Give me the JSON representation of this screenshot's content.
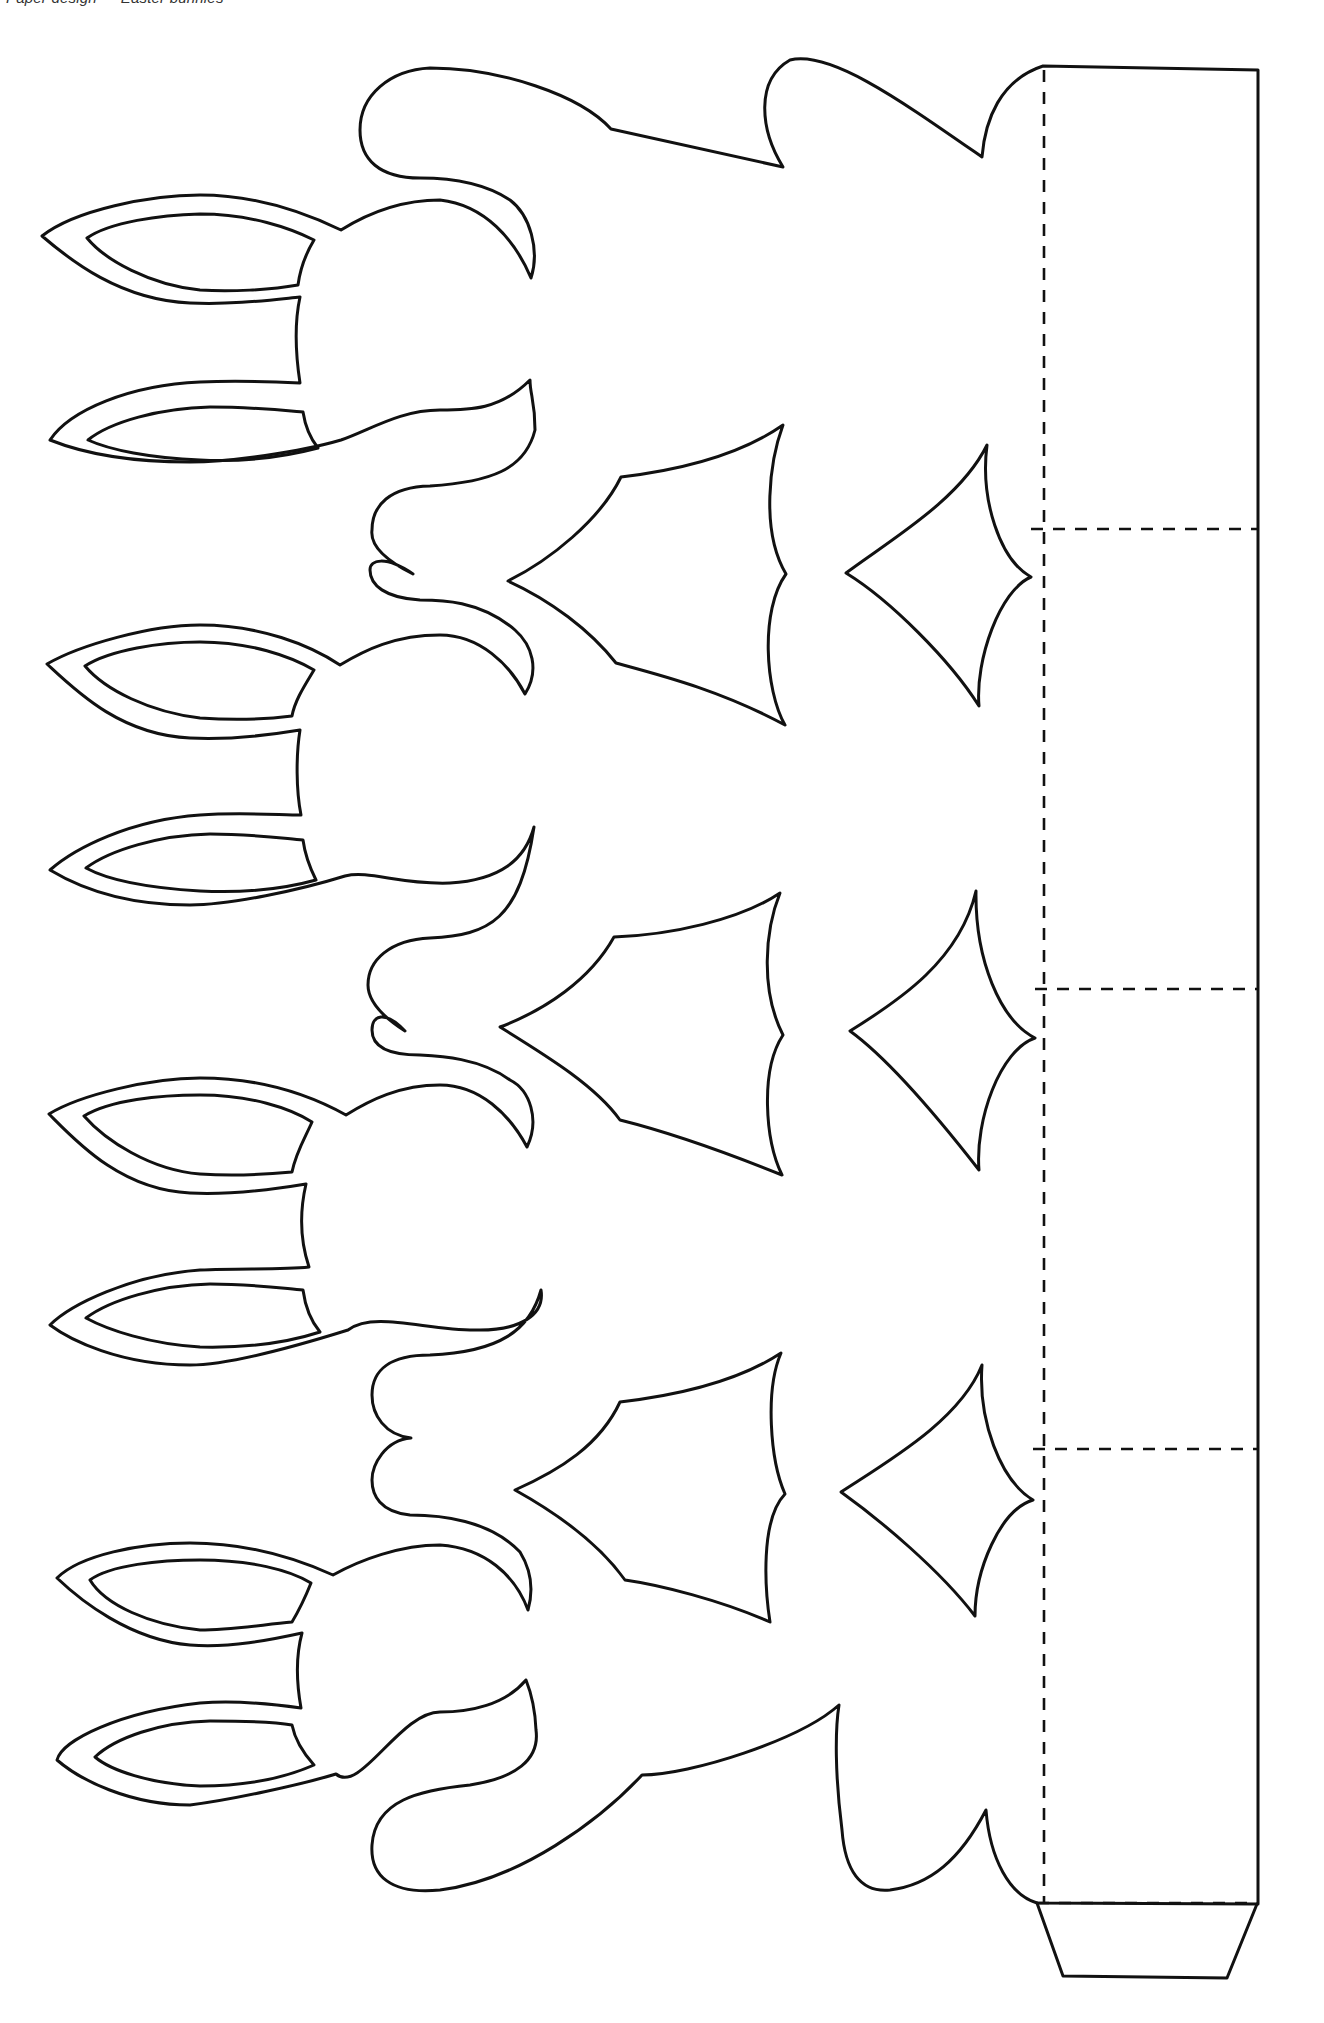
{
  "document": {
    "header_text": "Paper design — Easter bunnies",
    "header_note": "clipped at top edge of page",
    "title": "Easter bunny basket template",
    "line_legend": {
      "cut_line": "solid line = cut",
      "fold_line": "dashed line = fold"
    }
  },
  "template": {
    "bunny_count": 4,
    "panel_count": 4,
    "panels": [
      {
        "index": 1,
        "label": "Panel 1"
      },
      {
        "index": 2,
        "label": "Panel 2"
      },
      {
        "index": 3,
        "label": "Panel 3"
      },
      {
        "index": 4,
        "label": "Panel 4"
      }
    ],
    "glue_tab_label": "Glue tab",
    "ink_color": "#111111",
    "paper_color": "#ffffff"
  }
}
